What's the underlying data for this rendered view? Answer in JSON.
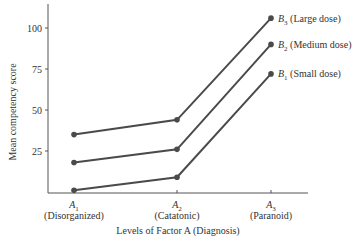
{
  "chart_data": {
    "type": "line",
    "title": "",
    "xlabel": "Levels of Factor A (Diagnosis)",
    "ylabel": "Mean competency score",
    "ylim": [
      0,
      115
    ],
    "yticks": [
      25,
      50,
      75,
      100
    ],
    "grid": false,
    "legend_position": "right, inline at line ends",
    "categories": [
      {
        "main": "A",
        "sub": "1",
        "desc": "(Disorganized)"
      },
      {
        "main": "A",
        "sub": "2",
        "desc": "(Catatonic)"
      },
      {
        "main": "A",
        "sub": "3",
        "desc": "(Paranoid)"
      }
    ],
    "series": [
      {
        "name": "B3 (Large dose)",
        "main": "B",
        "sub": "3",
        "desc": " (Large dose)",
        "values": [
          35,
          44,
          106
        ]
      },
      {
        "name": "B2 (Medium dose)",
        "main": "B",
        "sub": "2",
        "desc": " (Medium dose)",
        "values": [
          18,
          26,
          90
        ]
      },
      {
        "name": "B1 (Small dose)",
        "main": "B",
        "sub": "1",
        "desc": " (Small dose)",
        "values": [
          1,
          9,
          72
        ]
      }
    ],
    "line_color": "#4a4a4a"
  }
}
